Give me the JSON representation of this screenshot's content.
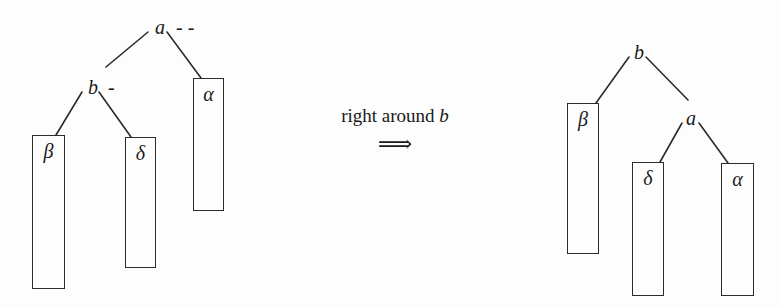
{
  "figure": {
    "kind": "avl-rotation-diagram",
    "background_color": "#fdfdfd",
    "ink_color": "#1a1a1a",
    "width": 780,
    "height": 307
  },
  "caption": {
    "prefix": "right around ",
    "node": "b",
    "arrow": "⟹"
  },
  "left_tree": {
    "name": "before-rotation-tree",
    "nodes": [
      {
        "id": "a",
        "label": "a",
        "balance_mark": "- -",
        "x": 155,
        "y": 17
      },
      {
        "id": "b",
        "label": "b",
        "balance_mark": "-",
        "x": 88,
        "y": 77
      }
    ],
    "subtrees": [
      {
        "id": "beta",
        "label": "β",
        "x": 32,
        "y": 135,
        "w": 33,
        "h": 154
      },
      {
        "id": "delta",
        "label": "δ",
        "x": 125,
        "y": 137,
        "w": 31,
        "h": 131
      },
      {
        "id": "alpha",
        "label": "α",
        "x": 193,
        "y": 78,
        "w": 31,
        "h": 133
      }
    ],
    "edges": [
      {
        "from": "a",
        "to": "b",
        "x1": 148,
        "y1": 32,
        "x2": 106,
        "y2": 67
      },
      {
        "from": "a",
        "to": "alpha",
        "x1": 167,
        "y1": 32,
        "x2": 201,
        "y2": 78
      },
      {
        "from": "b",
        "to": "beta",
        "x1": 82,
        "y1": 92,
        "x2": 56,
        "y2": 135
      },
      {
        "from": "b",
        "to": "delta",
        "x1": 99,
        "y1": 92,
        "x2": 131,
        "y2": 137
      }
    ]
  },
  "right_tree": {
    "name": "after-rotation-tree",
    "nodes": [
      {
        "id": "b",
        "label": "b",
        "balance_mark": "",
        "x": 634,
        "y": 42
      },
      {
        "id": "a",
        "label": "a",
        "balance_mark": "",
        "x": 686,
        "y": 108
      }
    ],
    "subtrees": [
      {
        "id": "beta",
        "label": "β",
        "x": 567,
        "y": 103,
        "w": 32,
        "h": 151
      },
      {
        "id": "delta",
        "label": "δ",
        "x": 632,
        "y": 162,
        "w": 32,
        "h": 134
      },
      {
        "id": "alpha",
        "label": "α",
        "x": 721,
        "y": 163,
        "w": 33,
        "h": 133
      }
    ],
    "edges": [
      {
        "from": "b",
        "to": "beta",
        "x1": 629,
        "y1": 57,
        "x2": 596,
        "y2": 103
      },
      {
        "from": "b",
        "to": "a",
        "x1": 646,
        "y1": 57,
        "x2": 688,
        "y2": 100
      },
      {
        "from": "a",
        "to": "delta",
        "x1": 682,
        "y1": 123,
        "x2": 660,
        "y2": 162
      },
      {
        "from": "a",
        "to": "alpha",
        "x1": 699,
        "y1": 123,
        "x2": 728,
        "y2": 163
      }
    ]
  }
}
